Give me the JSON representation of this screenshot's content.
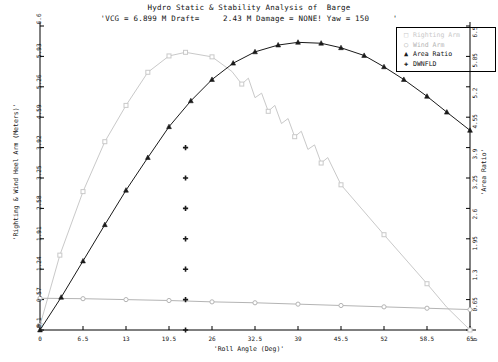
{
  "title": {
    "main": "Hydro Static & Stability Analysis of  Barge",
    "sub": "'VCG = 6.899 M Draft=     2.43 M Damage = NONE! Yaw = 150     '"
  },
  "axes": {
    "x_title": "'Roll Angle (Deg)'",
    "y_left_title": "'Righting & Wind Heel Arm (Meters)'",
    "y_right_title": "'Area Ratio'",
    "x_ticks": [
      "0",
      "6.5",
      "13",
      "19.5",
      "26",
      "32.5",
      "39",
      "45.5",
      "52",
      "58.5",
      "65"
    ],
    "y_left_ticks": [
      "0",
      "-0.1",
      "0.57",
      "1.24",
      "1.91",
      "2.58",
      "3.25",
      "3.92",
      "4.59",
      "5.26",
      "5.93",
      "6.6"
    ],
    "y_right_ticks": [
      "0",
      "0.65",
      "1.3",
      "1.95",
      "2.6",
      "3.25",
      "3.9",
      "4.55",
      "5.2",
      "5.85",
      "6.5"
    ]
  },
  "legend": {
    "items": [
      {
        "label": "Righting Arm",
        "marker": "square",
        "color": "#c9c9c9"
      },
      {
        "label": "Wind Arm",
        "marker": "circle",
        "color": "#b4b4b4"
      },
      {
        "label": "Area Ratio",
        "marker": "triangle",
        "color": "#1a1a1a"
      },
      {
        "label": "DWNFLD",
        "marker": "plus",
        "color": "#1a1a1a"
      }
    ]
  },
  "colors": {
    "righting_arm": "#c9c9c9",
    "wind_arm": "#b4b4b4",
    "area_ratio": "#1a1a1a",
    "dwnfld": "#1a1a1a",
    "axis": "#000000"
  },
  "chart_data": {
    "type": "line",
    "title": "Hydro Static & Stability Analysis of  Barge",
    "subtitle": "'VCG = 6.899 M Draft=     2.43 M Damage = NONE! Yaw = 150     '",
    "xlabel": "'Roll Angle (Deg)'",
    "ylabel": "'Righting & Wind Heel Arm (Meters)'",
    "ylabel_right": "'Area Ratio'",
    "xlim": [
      0,
      65
    ],
    "ylim": [
      -0.1,
      6.6
    ],
    "ylim_right": [
      0,
      6.5
    ],
    "grid": false,
    "legend_position": "top-right",
    "series": [
      {
        "name": "Righting Arm",
        "axis": "left",
        "marker": "square",
        "color": "#c9c9c9",
        "points": [
          [
            0.0,
            0.0
          ],
          [
            3.0,
            1.55
          ],
          [
            6.5,
            2.95
          ],
          [
            9.8,
            4.05
          ],
          [
            13.0,
            4.85
          ],
          [
            16.3,
            5.58
          ],
          [
            19.5,
            5.94
          ],
          [
            22.0,
            6.02
          ],
          [
            26.0,
            5.92
          ],
          [
            29.0,
            5.6
          ],
          [
            30.5,
            5.32
          ],
          [
            31.5,
            5.45
          ],
          [
            32.5,
            5.02
          ],
          [
            33.5,
            5.12
          ],
          [
            34.5,
            4.72
          ],
          [
            35.5,
            4.85
          ],
          [
            36.5,
            4.45
          ],
          [
            37.5,
            4.56
          ],
          [
            38.5,
            4.16
          ],
          [
            39.5,
            4.28
          ],
          [
            40.5,
            3.88
          ],
          [
            41.5,
            3.98
          ],
          [
            42.5,
            3.58
          ],
          [
            43.5,
            3.7
          ],
          [
            45.5,
            3.1
          ],
          [
            52.0,
            2.0
          ],
          [
            58.5,
            0.92
          ],
          [
            61.5,
            0.4
          ],
          [
            65.0,
            -0.1
          ]
        ]
      },
      {
        "name": "Wind Arm",
        "axis": "left",
        "marker": "circle",
        "color": "#b4b4b4",
        "points": [
          [
            0.0,
            0.6
          ],
          [
            6.5,
            0.59
          ],
          [
            13.0,
            0.57
          ],
          [
            19.5,
            0.55
          ],
          [
            26.0,
            0.52
          ],
          [
            32.5,
            0.5
          ],
          [
            39.0,
            0.47
          ],
          [
            45.5,
            0.44
          ],
          [
            52.0,
            0.41
          ],
          [
            58.5,
            0.38
          ],
          [
            65.0,
            0.35
          ]
        ]
      },
      {
        "name": "Area Ratio",
        "axis": "left",
        "marker": "triangle",
        "color": "#1a1a1a",
        "points": [
          [
            0.0,
            -0.1
          ],
          [
            3.2,
            0.62
          ],
          [
            6.5,
            1.42
          ],
          [
            9.8,
            2.22
          ],
          [
            13.0,
            2.98
          ],
          [
            16.3,
            3.7
          ],
          [
            19.5,
            4.38
          ],
          [
            22.8,
            4.95
          ],
          [
            26.0,
            5.42
          ],
          [
            29.2,
            5.78
          ],
          [
            32.5,
            6.03
          ],
          [
            36.0,
            6.18
          ],
          [
            39.0,
            6.24
          ],
          [
            42.5,
            6.22
          ],
          [
            45.5,
            6.12
          ],
          [
            49.0,
            5.95
          ],
          [
            52.0,
            5.7
          ],
          [
            55.0,
            5.42
          ],
          [
            58.5,
            5.05
          ],
          [
            61.5,
            4.7
          ],
          [
            65.0,
            4.3
          ]
        ]
      },
      {
        "name": "DWNFLD",
        "axis": "left",
        "marker": "plus",
        "color": "#1a1a1a",
        "x": 22.0,
        "points": [
          [
            22.0,
            -0.1
          ],
          [
            22.0,
            0.57
          ],
          [
            22.0,
            1.24
          ],
          [
            22.0,
            1.91
          ],
          [
            22.0,
            2.58
          ],
          [
            22.0,
            3.25
          ],
          [
            22.0,
            3.92
          ]
        ]
      }
    ]
  }
}
